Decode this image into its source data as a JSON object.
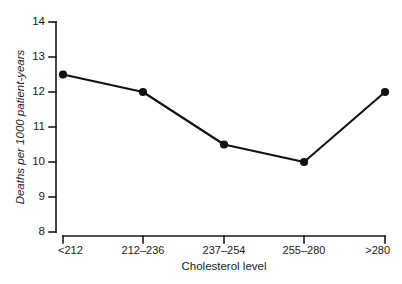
{
  "chart_data": {
    "type": "line",
    "title": "",
    "subtitle": "",
    "xlabel": "Cholesterol level",
    "ylabel": "Deaths per 1000 patient-years",
    "categories": [
      "<212",
      "212–236",
      "237–254",
      "255–280",
      ">280"
    ],
    "values": [
      12.5,
      12.0,
      10.5,
      10.0,
      12.0
    ],
    "series": [
      {
        "name": "Deaths per 1000 patient-years",
        "values": [
          12.5,
          12.0,
          10.5,
          10.0,
          12.0
        ]
      }
    ],
    "ylim": [
      8,
      14
    ],
    "ytick_labels": [
      "8",
      "9",
      "10",
      "11",
      "12",
      "13",
      "14"
    ],
    "ytick_values": [
      8,
      9,
      10,
      11,
      12,
      13,
      14
    ],
    "xtick_labels": [
      "<212",
      "212–236",
      "237–254",
      "255–280",
      ">280"
    ],
    "grid": false,
    "legend": false,
    "legend_position": "none",
    "marker": "filled-circle",
    "line_color": "#111111",
    "marker_color": "#111111",
    "axis_color": "#1a1a1a",
    "background_color": "#ffffff",
    "annotations": []
  }
}
